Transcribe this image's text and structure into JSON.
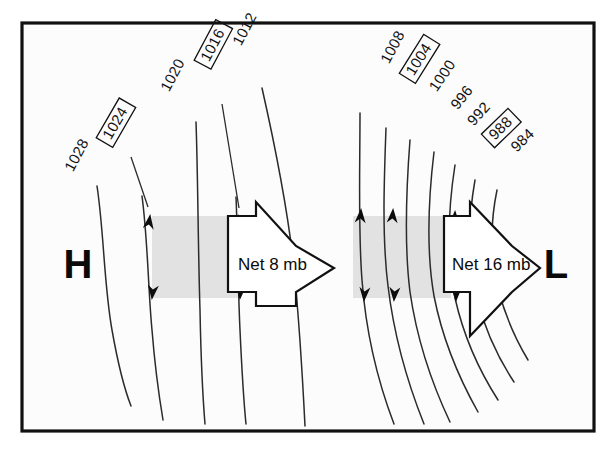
{
  "figure": {
    "frame": {
      "x": 22,
      "y": 23,
      "width": 572,
      "height": 408
    },
    "background_color": "#fcfcfc",
    "line_color": "#2b2b2b",
    "shade_color": "#e2e2e2",
    "pressure_unit": "mb"
  },
  "centers": [
    {
      "name": "high-pressure-center",
      "label": "H",
      "x": 78,
      "y": 278
    },
    {
      "name": "low-pressure-center",
      "label": "L",
      "x": 556,
      "y": 278
    }
  ],
  "net_arrows": [
    {
      "name": "net-gradient-arrow-left",
      "label": "Net 8 mb",
      "value": 8,
      "unit": "mb",
      "direction": "right",
      "text_x": 238,
      "text_y": 270
    },
    {
      "name": "net-gradient-arrow-right",
      "label": "Net 16 mb",
      "value": 16,
      "unit": "mb",
      "direction": "right",
      "text_x": 452,
      "text_y": 270
    }
  ],
  "shade_bands": [
    {
      "name": "shade-band-left",
      "x": 152,
      "y": 216,
      "width": 88,
      "height": 82
    },
    {
      "name": "shade-band-right",
      "x": 353,
      "y": 216,
      "width": 98,
      "height": 82
    }
  ],
  "isobars": [
    {
      "label": "1028",
      "value": 1028,
      "boxed": false,
      "group": "high",
      "label_x": 72,
      "label_y": 172,
      "label_rotate": -62,
      "path": "M 97,186 C 104,232 104,286 112,330 C 118,364 124,388 131,406",
      "leader": "",
      "arrow_top": null,
      "arrow_bottom": null
    },
    {
      "label": "1024",
      "value": 1024,
      "boxed": true,
      "group": "high",
      "label_x": 110,
      "label_y": 140,
      "label_rotate": -60,
      "path": "M 142,196 C 148,242 148,288 152,330 C 155,368 159,396 163,420",
      "leader": "M 131,157 L 148,207",
      "arrow_top": {
        "x": 150,
        "y": 216,
        "rotate": 188
      },
      "arrow_bottom": {
        "x": 152,
        "y": 298,
        "rotate": 6
      }
    },
    {
      "label": "1020",
      "value": 1020,
      "boxed": false,
      "group": "high",
      "label_x": 168,
      "label_y": 92,
      "label_rotate": -62,
      "path": "M 196,122 C 198,178 198,248 200,310 C 201,362 203,400 205,424",
      "leader": "",
      "arrow_top": null,
      "arrow_bottom": null
    },
    {
      "label": "1016",
      "value": 1016,
      "boxed": true,
      "group": "high",
      "label_x": 208,
      "label_y": 62,
      "label_rotate": -62,
      "path": "M 236,197 C 238,244 238,290 240,330 C 242,374 244,404 246,424",
      "leader": "M 222,104 L 239,208",
      "arrow_top": {
        "x": 238,
        "y": 216,
        "rotate": 186
      },
      "arrow_bottom": {
        "x": 240,
        "y": 298,
        "rotate": 4
      }
    },
    {
      "label": "1012",
      "value": 1012,
      "boxed": false,
      "group": "high",
      "label_x": 240,
      "label_y": 46,
      "label_rotate": -62,
      "path": "M 262,88 C 276,150 288,212 294,268 C 300,330 303,386 305,426",
      "leader": "",
      "arrow_top": null,
      "arrow_bottom": null
    },
    {
      "label": "1008",
      "value": 1008,
      "boxed": false,
      "group": "low",
      "label_x": 388,
      "label_y": 64,
      "label_rotate": -62,
      "path": "M 360,113 C 360,170 358,230 362,280 C 366,334 378,382 394,424",
      "leader": "",
      "arrow_top": {
        "x": 361,
        "y": 210,
        "rotate": 184
      },
      "arrow_bottom": {
        "x": 364,
        "y": 300,
        "rotate": 4
      }
    },
    {
      "label": "1004",
      "value": 1004,
      "boxed": true,
      "group": "low",
      "label_x": 413,
      "label_y": 76,
      "label_rotate": -58,
      "path": "M 386,128 C 384,182 382,238 388,286 C 394,336 408,384 424,424",
      "leader": "",
      "arrow_top": null,
      "arrow_bottom": null
    },
    {
      "label": "1000",
      "value": 1000,
      "boxed": false,
      "group": "low",
      "label_x": 436,
      "label_y": 92,
      "label_rotate": -56,
      "path": "M 410,140 C 406,192 404,244 410,292 C 417,340 432,384 450,422",
      "leader": "",
      "arrow_top": null,
      "arrow_bottom": null
    },
    {
      "label": "996",
      "value": 996,
      "boxed": false,
      "group": "low",
      "label_x": 457,
      "label_y": 110,
      "label_rotate": -52,
      "path": "M 434,152 C 428,202 426,250 434,296 C 443,342 460,380 478,412",
      "leader": "",
      "arrow_top": null,
      "arrow_bottom": null
    },
    {
      "label": "992",
      "value": 992,
      "boxed": false,
      "group": "low",
      "label_x": 473,
      "label_y": 126,
      "label_rotate": -48,
      "path": "M 455,165 C 448,210 446,254 455,298 C 464,338 480,372 498,400",
      "leader": "",
      "arrow_top": {
        "x": 455,
        "y": 212,
        "rotate": 182
      },
      "arrow_bottom": {
        "x": 456,
        "y": 300,
        "rotate": 2
      }
    },
    {
      "label": "988",
      "value": 988,
      "boxed": true,
      "group": "low",
      "label_x": 494,
      "label_y": 140,
      "label_rotate": -44,
      "path": "M 475,180 C 468,220 467,258 476,296 C 485,330 498,358 514,382",
      "leader": "",
      "arrow_top": null,
      "arrow_bottom": null
    },
    {
      "label": "984",
      "value": 984,
      "boxed": false,
      "group": "low",
      "label_x": 516,
      "label_y": 152,
      "label_rotate": -44,
      "path": "M 497,190 C 490,224 490,256 498,288 C 505,316 516,340 528,360",
      "leader": "",
      "arrow_top": null,
      "arrow_bottom": null
    }
  ],
  "bleed_text": [
    {
      "text": "",
      "x": 60,
      "y": 8
    },
    {
      "text": "",
      "x": 60,
      "y": 30
    }
  ]
}
